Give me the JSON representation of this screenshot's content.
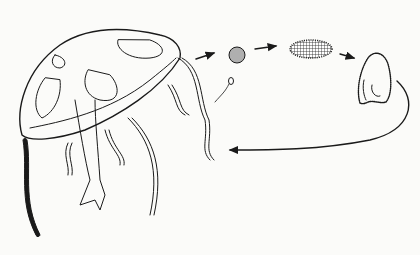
{
  "figure": {
    "colors": {
      "background": "#fbfbf9",
      "ink": "#1a1a1a"
    },
    "stages": [
      {
        "id": "medusa",
        "label": ""
      },
      {
        "id": "sperm",
        "label": ""
      },
      {
        "id": "egg",
        "label": ""
      },
      {
        "id": "planula",
        "label": ""
      },
      {
        "id": "polyp",
        "label": ""
      }
    ]
  }
}
